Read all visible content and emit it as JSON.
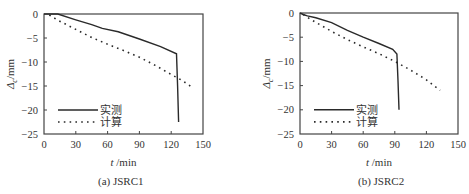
{
  "chart_data": [
    {
      "type": "line",
      "title": "(a) JSRC1",
      "xlabel": "t /min",
      "ylabel": "Δc/mm",
      "xlim": [
        0,
        150
      ],
      "ylim": [
        -25,
        0
      ],
      "xticks": [
        0,
        30,
        60,
        90,
        120,
        150
      ],
      "yticks": [
        0,
        -5,
        -10,
        -15,
        -20,
        -25
      ],
      "grid": false,
      "legend_position": "lower left",
      "series": [
        {
          "name": "实测",
          "style": "solid",
          "x": [
            0,
            5,
            13,
            30,
            45,
            55,
            70,
            90,
            110,
            125,
            126,
            127
          ],
          "y": [
            0,
            0,
            0,
            -1.2,
            -2.2,
            -3.0,
            -3.7,
            -5.2,
            -6.8,
            -8.3,
            -15,
            -22.5
          ]
        },
        {
          "name": "计算",
          "style": "dotted",
          "x": [
            5,
            13,
            30,
            45,
            60,
            75,
            90,
            105,
            120,
            130,
            138
          ],
          "y": [
            -0.2,
            -1.3,
            -3.2,
            -4.9,
            -6.3,
            -7.6,
            -9.0,
            -10.7,
            -12.6,
            -13.8,
            -15.0
          ]
        }
      ]
    },
    {
      "type": "line",
      "title": "(b) JSRC2",
      "xlabel": "t /min",
      "ylabel": "Δc/mm",
      "xlim": [
        0,
        150
      ],
      "ylim": [
        -25,
        0
      ],
      "xticks": [
        0,
        30,
        60,
        90,
        120,
        150
      ],
      "yticks": [
        0,
        -5,
        -10,
        -15,
        -20,
        -25
      ],
      "grid": false,
      "legend_position": "lower left",
      "series": [
        {
          "name": "实测",
          "style": "solid",
          "x": [
            0,
            3,
            7,
            15,
            30,
            45,
            60,
            75,
            88,
            92,
            93,
            94
          ],
          "y": [
            0,
            -0.3,
            -0.6,
            -1.0,
            -2.0,
            -3.6,
            -5.0,
            -6.3,
            -7.5,
            -8.5,
            -14,
            -20.0
          ]
        },
        {
          "name": "计算",
          "style": "dotted",
          "x": [
            3,
            10,
            30,
            45,
            60,
            75,
            90,
            105,
            120,
            133
          ],
          "y": [
            -0.3,
            -1.3,
            -3.8,
            -5.5,
            -7.0,
            -8.4,
            -10.0,
            -11.8,
            -13.8,
            -16.0
          ]
        }
      ]
    }
  ],
  "panels": [
    {
      "caption": "(a)  JSRC1",
      "xlabel_t": "t",
      "xlabel_unit": " /min",
      "ylabel_delta": "Δ",
      "ylabel_sub": "c",
      "ylabel_unit": "/mm",
      "legend": [
        "实测",
        "计算"
      ],
      "xtick_labels": [
        "0",
        "30",
        "60",
        "90",
        "120",
        "150"
      ],
      "ytick_labels": [
        "0",
        "−5",
        "−10",
        "−15",
        "−20",
        "−25"
      ]
    },
    {
      "caption": "(b)  JSRC2",
      "xlabel_t": "t",
      "xlabel_unit": " /min",
      "ylabel_delta": "Δ",
      "ylabel_sub": "c",
      "ylabel_unit": "/mm",
      "legend": [
        "实测",
        "计算"
      ],
      "xtick_labels": [
        "0",
        "30",
        "60",
        "90",
        "120",
        "150"
      ],
      "ytick_labels": [
        "0",
        "−5",
        "−10",
        "−15",
        "−20",
        "−25"
      ]
    }
  ]
}
